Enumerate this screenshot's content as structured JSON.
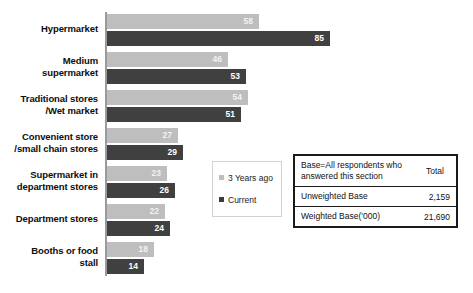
{
  "chart_data": {
    "type": "bar",
    "orientation": "horizontal",
    "title": "",
    "xlabel": "",
    "ylabel": "",
    "xlim": [
      0,
      90
    ],
    "grid": false,
    "legend_position": "middle-right",
    "categories": [
      "Hypermarket",
      "Medium\nsupermarket",
      "Traditional stores\n/Wet market",
      "Convenient store\n/small chain stores",
      "Supermarket in\ndepartment stores",
      "Department stores",
      "Booths or food\nstall"
    ],
    "series": [
      {
        "name": "3 Years ago",
        "color": "#bebebe",
        "values": [
          58,
          46,
          54,
          27,
          23,
          22,
          18
        ]
      },
      {
        "name": "Current",
        "color": "#404040",
        "values": [
          85,
          53,
          51,
          29,
          26,
          24,
          14
        ]
      }
    ]
  },
  "categories_display": [
    {
      "line1": "Hypermarket",
      "line2": ""
    },
    {
      "line1": "Medium",
      "line2": "supermarket"
    },
    {
      "line1": "Traditional stores",
      "line2": "/Wet market"
    },
    {
      "line1": "Convenient store",
      "line2": "/small chain stores"
    },
    {
      "line1": "Supermarket in",
      "line2": "department stores"
    },
    {
      "line1": "Department stores",
      "line2": ""
    },
    {
      "line1": "Booths or food",
      "line2": "stall"
    }
  ],
  "values": {
    "prev": [
      "58",
      "46",
      "54",
      "27",
      "23",
      "22",
      "18"
    ],
    "curr": [
      "85",
      "53",
      "51",
      "29",
      "26",
      "24",
      "14"
    ]
  },
  "legend": {
    "items": [
      {
        "label": "3 Years ago"
      },
      {
        "label": "Current"
      }
    ]
  },
  "base_table": {
    "header_label": "Base=All respondents who answered this section",
    "header_label_line1": "Base=All respondents who",
    "header_label_line2": "answered this section",
    "header_total": "Total",
    "rows": [
      {
        "label": "Unweighted Base",
        "value": "2,159"
      },
      {
        "label": "Weighted Base('000)",
        "value": "21,690"
      }
    ]
  },
  "footer": {
    "note": ""
  },
  "colors": {
    "series_prev": "#bebebe",
    "series_curr": "#404040",
    "axis": "#9a9a9a",
    "table_border": "#1a1a1a",
    "legend_border": "#d2d2d2",
    "text": "#0d0d0d"
  }
}
